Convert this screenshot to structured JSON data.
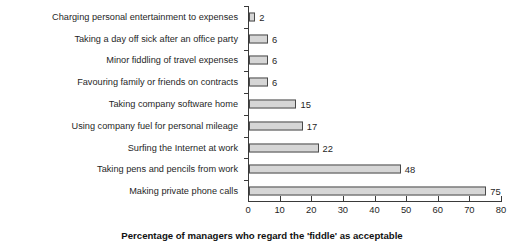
{
  "chart_data": {
    "type": "bar",
    "orientation": "horizontal",
    "title": "",
    "subtitle": "",
    "xlabel": "Percentage of managers who regard the 'fiddle' as acceptable",
    "ylabel": "",
    "xlim": [
      0,
      80
    ],
    "xticks": [
      0,
      10,
      20,
      30,
      40,
      50,
      60,
      70,
      80
    ],
    "xtick_labels": [
      "0",
      "10",
      "20",
      "30",
      "40",
      "50",
      "60",
      "70",
      "80"
    ],
    "grid": false,
    "legend": null,
    "data_labels": true,
    "bar_fill": "#d6d6d6",
    "bar_border": "#4a4a4a",
    "categories": [
      "Charging personal entertainment to expenses",
      "Taking a day off sick after an office party",
      "Minor fiddling of travel expenses",
      "Favouring family or friends on contracts",
      "Taking company software home",
      "Using company fuel for personal mileage",
      "Surfing the Internet at work",
      "Taking pens and pencils from work",
      "Making private phone calls"
    ],
    "values": [
      2,
      6,
      6,
      6,
      15,
      17,
      22,
      48,
      75
    ],
    "value_labels": [
      "2",
      "6",
      "6",
      "6",
      "15",
      "17",
      "22",
      "48",
      "75"
    ]
  }
}
